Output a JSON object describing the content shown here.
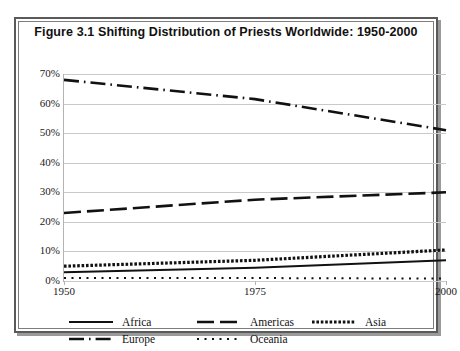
{
  "figure": {
    "title": "Figure 3.1 Shifting Distribution of Priests Worldwide: 1950-2000",
    "border_color": "#5a5a5a",
    "background": "#ffffff"
  },
  "chart_data": {
    "type": "line",
    "title": "Figure 3.1 Shifting Distribution of Priests Worldwide: 1950-2000",
    "xlabel": "",
    "ylabel": "",
    "x": [
      1950,
      1975,
      2000
    ],
    "xlim": [
      1950,
      2000
    ],
    "ylim": [
      0,
      70
    ],
    "x_tick_labels": [
      "1950",
      "1975",
      "2000"
    ],
    "y_tick_labels": [
      "0%",
      "10%",
      "20%",
      "30%",
      "40%",
      "50%",
      "60%",
      "70%"
    ],
    "y_tick_values": [
      0,
      10,
      20,
      30,
      40,
      50,
      60,
      70
    ],
    "grid": true,
    "legend_position": "bottom",
    "units": "percent",
    "series": [
      {
        "name": "Africa",
        "style": "solid",
        "color": "#111111",
        "values": [
          3.0,
          4.5,
          7.0
        ]
      },
      {
        "name": "Americas",
        "style": "dashed",
        "color": "#111111",
        "values": [
          23.0,
          27.5,
          30.0
        ]
      },
      {
        "name": "Asia",
        "style": "dotted-heavy",
        "color": "#111111",
        "values": [
          5.0,
          7.0,
          10.5
        ]
      },
      {
        "name": "Europe",
        "style": "dash-dot",
        "color": "#111111",
        "values": [
          68.0,
          61.5,
          51.0
        ]
      },
      {
        "name": "Oceania",
        "style": "dotted-fine",
        "color": "#111111",
        "values": [
          1.0,
          1.0,
          0.8
        ]
      }
    ]
  },
  "legend": {
    "rows": [
      [
        {
          "label": "Africa",
          "style": "solid"
        },
        {
          "label": "Americas",
          "style": "dashed"
        },
        {
          "label": "Asia",
          "style": "dotted-heavy"
        }
      ],
      [
        {
          "label": "Europe",
          "style": "dash-dot"
        },
        {
          "label": "Oceania",
          "style": "dotted-fine"
        }
      ]
    ]
  }
}
